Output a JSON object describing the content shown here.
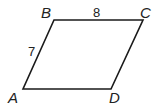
{
  "figure": {
    "shape": "parallelogram",
    "vertices": {
      "A": {
        "label": "A"
      },
      "B": {
        "label": "B"
      },
      "C": {
        "label": "C"
      },
      "D": {
        "label": "D"
      }
    },
    "side_labels": {
      "AB": "7",
      "BC": "8"
    },
    "stroke_color": "#1a1a1a"
  }
}
